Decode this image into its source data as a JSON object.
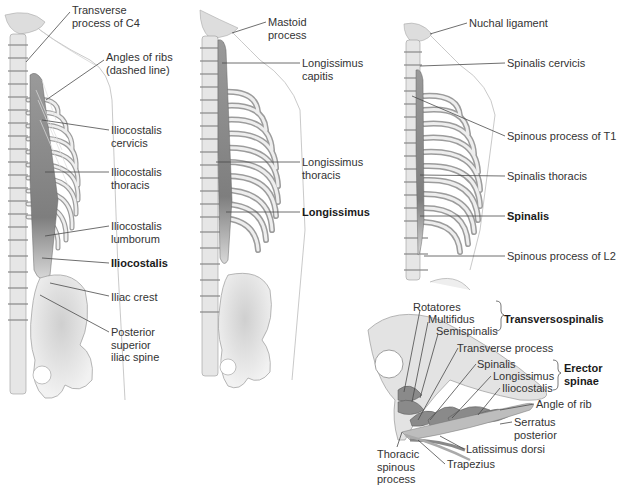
{
  "figure": {
    "panels": [
      {
        "id": "iliocostalis",
        "title": "Iliocostalis",
        "labels": [
          {
            "text": "Transverse\nprocess of C4",
            "x": 72,
            "y": 4
          },
          {
            "text": "Angles of ribs\n(dashed line)",
            "x": 106,
            "y": 51
          },
          {
            "text": "Iliocostalis\ncervicis",
            "x": 111,
            "y": 124
          },
          {
            "text": "Iliocostalis\nthoracis",
            "x": 111,
            "y": 166
          },
          {
            "text": "Iliocostalis\nlumborum",
            "x": 111,
            "y": 220
          },
          {
            "text": "Iliocostalis",
            "x": 111,
            "y": 257,
            "bold": true
          },
          {
            "text": "Iliac crest",
            "x": 111,
            "y": 291
          },
          {
            "text": "Posterior\nsuperior\niliac spine",
            "x": 111,
            "y": 326
          }
        ]
      },
      {
        "id": "longissimus",
        "title": "Longissimus",
        "labels": [
          {
            "text": "Mastoid\nprocess",
            "x": 268,
            "y": 16
          },
          {
            "text": "Longissimus\ncapitis",
            "x": 302,
            "y": 57
          },
          {
            "text": "Longissimus\nthoracis",
            "x": 302,
            "y": 156
          },
          {
            "text": "Longissimus",
            "x": 302,
            "y": 206,
            "bold": true
          }
        ]
      },
      {
        "id": "spinalis",
        "title": "Spinalis",
        "labels": [
          {
            "text": "Nuchal ligament",
            "x": 469,
            "y": 17
          },
          {
            "text": "Spinalis cervicis",
            "x": 507,
            "y": 57
          },
          {
            "text": "Spinous process of T1",
            "x": 507,
            "y": 130
          },
          {
            "text": "Spinalis thoracis",
            "x": 507,
            "y": 170
          },
          {
            "text": "Spinalis",
            "x": 507,
            "y": 210,
            "bold": true
          },
          {
            "text": "Spinous process of L2",
            "x": 507,
            "y": 250
          }
        ]
      },
      {
        "id": "cross-section",
        "title": "Cross section",
        "labels": [
          {
            "text": "Rotatores",
            "x": 413,
            "y": 301
          },
          {
            "text": "Multifidus",
            "x": 428,
            "y": 313
          },
          {
            "text": "Semispinalis",
            "x": 436,
            "y": 325
          },
          {
            "text": "Transversospinalis",
            "x": 504,
            "y": 313,
            "bold": true
          },
          {
            "text": "Transverse process",
            "x": 457,
            "y": 342
          },
          {
            "text": "Spinalis",
            "x": 477,
            "y": 358
          },
          {
            "text": "Longissimus",
            "x": 493,
            "y": 370
          },
          {
            "text": "Iliocostalis",
            "x": 502,
            "y": 382
          },
          {
            "text": "Erector\nspinae",
            "x": 564,
            "y": 362,
            "bold": true
          },
          {
            "text": "Angle of rib",
            "x": 536,
            "y": 398
          },
          {
            "text": "Serratus\nposterior",
            "x": 514,
            "y": 416
          },
          {
            "text": "Latissimus dorsi",
            "x": 466,
            "y": 443
          },
          {
            "text": "Thoracic\nspinous\nprocess",
            "x": 377,
            "y": 448
          },
          {
            "text": "Trapezius",
            "x": 447,
            "y": 458
          }
        ]
      }
    ]
  },
  "colors": {
    "bone": "#e9e9e9",
    "bone_stroke": "#8a8a8a",
    "muscle": "#8c8c8c",
    "muscle_dark": "#6e6e6e",
    "leader": "#4a4a4a",
    "text": "#333333"
  }
}
